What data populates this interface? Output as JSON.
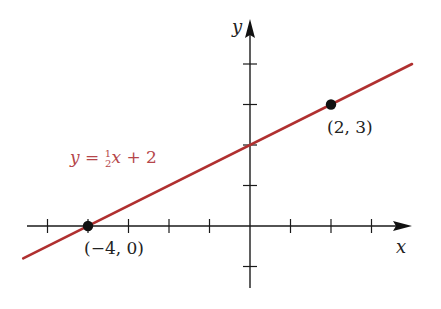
{
  "chart_data": {
    "type": "line",
    "title": "",
    "xlabel": "x",
    "ylabel": "y",
    "xlim": [
      -5.5,
      4
    ],
    "ylim": [
      -1.5,
      5.3
    ],
    "grid": false,
    "x_ticks": [
      -5,
      -4,
      -3,
      -2,
      -1,
      1,
      2,
      3
    ],
    "y_ticks": [
      -1,
      1,
      2,
      3,
      4
    ],
    "series": [
      {
        "name": "y = 1/2 x + 2",
        "equation": "y = ½x + 2",
        "slope": 0.5,
        "intercept": 2,
        "color": "#b03030",
        "x": [
          -5.6,
          4.0
        ],
        "y": [
          -0.8,
          4.0
        ]
      }
    ],
    "points": [
      {
        "x": -4,
        "y": 0,
        "label": "(−4, 0)"
      },
      {
        "x": 2,
        "y": 3,
        "label": "(2, 3)"
      }
    ],
    "annotations": [
      {
        "text": "y = ½x + 2",
        "color": "#b5464a"
      }
    ]
  },
  "labels": {
    "x_axis": "x",
    "y_axis": "y",
    "equation_y": "y",
    "equation_eq": " = ",
    "equation_num": "1",
    "equation_den": "2",
    "equation_x": "x",
    "equation_rest": " + 2",
    "point1": "(−4, 0)",
    "point2": "(2, 3)"
  }
}
